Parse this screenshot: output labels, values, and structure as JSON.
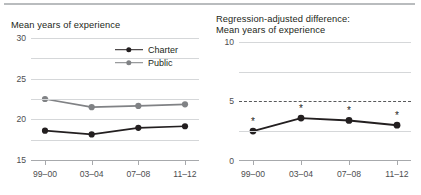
{
  "figure": {
    "top_rule_color": "#b9bcbe",
    "grid_color": "#d5d7d9",
    "axis_color": "#a7a9ac",
    "text_color": "#231f20"
  },
  "panels": {
    "left": {
      "title": "Mean years of experience",
      "legend": {
        "position": "inside-top-right",
        "entries": [
          {
            "label": "Charter",
            "color": "#231f20"
          },
          {
            "label": "Public",
            "color": "#808285"
          }
        ]
      }
    },
    "right": {
      "title": "Regression-adjusted difference:\nMean years of experience"
    }
  },
  "chart_data": [
    {
      "type": "line",
      "title": "Mean years of experience",
      "xlabel": "",
      "ylabel": "",
      "categories": [
        "99–00",
        "03–04",
        "07–08",
        "11–12"
      ],
      "ylim": [
        0,
        30
      ],
      "yticks": [
        0,
        5,
        10,
        15,
        20,
        25,
        30
      ],
      "ytick_labels": [
        "0",
        "5",
        "10",
        "15",
        "20",
        "25",
        "30"
      ],
      "grid": true,
      "legend_position": "inside top-right",
      "series": [
        {
          "name": "Charter",
          "color": "#231f20",
          "values": [
            7.2,
            6.3,
            7.9,
            8.3
          ]
        },
        {
          "name": "Public",
          "color": "#808285",
          "values": [
            15.0,
            13.0,
            13.3,
            13.7
          ]
        }
      ]
    },
    {
      "type": "line",
      "title": "Regression-adjusted difference: Mean years of experience",
      "xlabel": "",
      "ylabel": "",
      "categories": [
        "99–00",
        "03–04",
        "07–08",
        "11–12"
      ],
      "ylim": [
        -10,
        10
      ],
      "yticks": [
        -10,
        -5,
        0,
        5,
        10
      ],
      "ytick_labels": [
        "−10",
        "−5",
        "0",
        "5",
        "10"
      ],
      "grid": true,
      "zero_reference_line": {
        "value": 0,
        "style": "dashed",
        "color": "#58595b"
      },
      "legend_position": "none",
      "series": [
        {
          "name": "Regression-adjusted difference",
          "color": "#231f20",
          "values": [
            -5.1,
            -2.9,
            -3.3,
            -4.1
          ],
          "significance_markers": [
            "*",
            "*",
            "*",
            "*"
          ]
        }
      ]
    }
  ]
}
